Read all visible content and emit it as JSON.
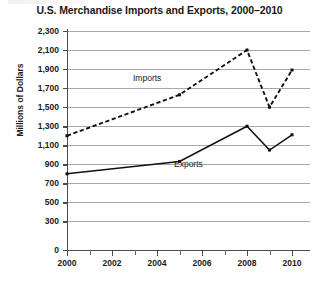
{
  "chart_data": {
    "type": "line",
    "title": "U.S. Merchandise Imports and Exports, 2000–2010",
    "xlabel": "",
    "ylabel": "Millions of Dollars",
    "x": [
      2000,
      2005,
      2008,
      2009,
      2010
    ],
    "xlim": [
      1999.5,
      2010.8
    ],
    "ylim": [
      0,
      2300
    ],
    "ytick_labels": [
      "2,300",
      "2,100",
      "1,900",
      "1,700",
      "1,500",
      "1,300",
      "1,100",
      "900",
      "700",
      "500",
      "300",
      "0"
    ],
    "ytick_values": [
      2300,
      2100,
      1900,
      1700,
      1500,
      1300,
      1100,
      900,
      700,
      500,
      300,
      0
    ],
    "xtick_labels": [
      "2000",
      "2002",
      "2004",
      "2006",
      "2008",
      "2010"
    ],
    "xtick_values": [
      2000,
      2002,
      2004,
      2006,
      2008,
      2010
    ],
    "xtick_minor_values": [
      2001,
      2003,
      2005,
      2007,
      2009
    ],
    "grid": "horizontal",
    "legend_position": "inline-labels",
    "series": [
      {
        "name": "Imports",
        "label": "Imports",
        "style": "dashed",
        "color": "#111111",
        "x": [
          2000,
          2005,
          2008,
          2009,
          2010
        ],
        "values": [
          1200,
          1630,
          2100,
          1500,
          1890
        ]
      },
      {
        "name": "Exports",
        "label": "Exports",
        "style": "solid",
        "color": "#111111",
        "x": [
          2000,
          2005,
          2008,
          2009,
          2010
        ],
        "values": [
          800,
          930,
          1300,
          1050,
          1210
        ]
      }
    ]
  }
}
